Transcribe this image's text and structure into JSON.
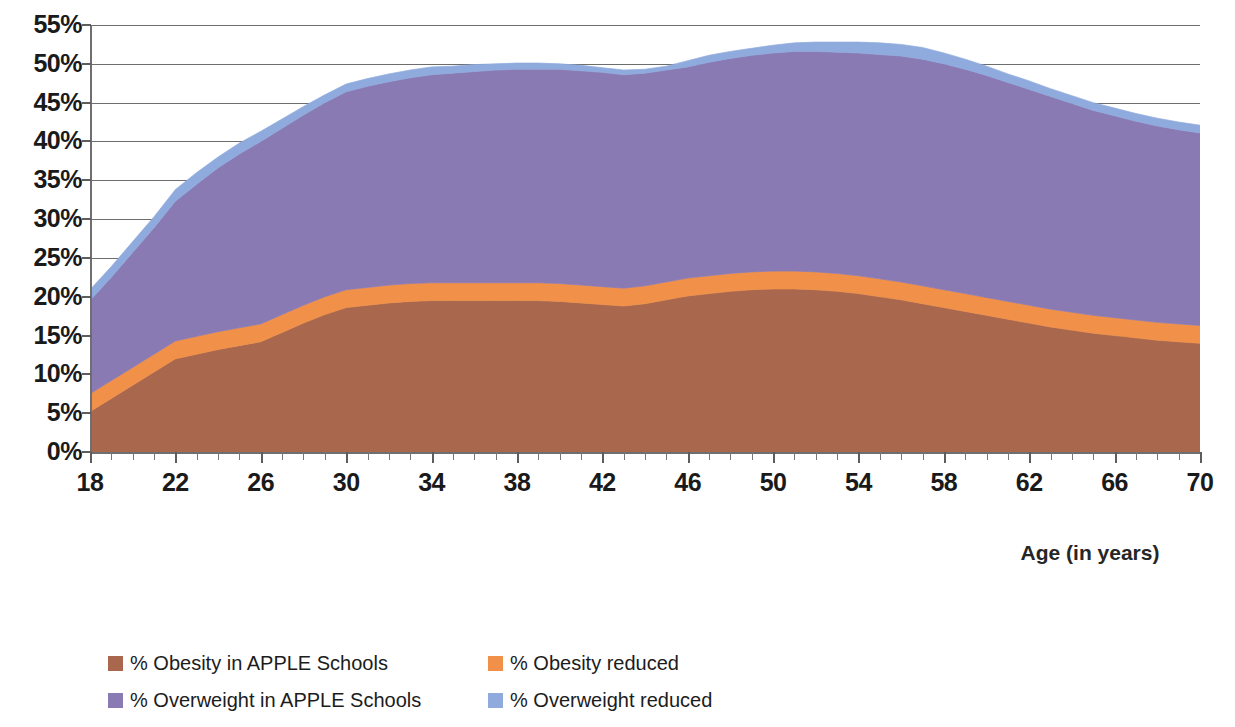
{
  "chart_data": {
    "type": "area",
    "stacked": true,
    "title": "",
    "xlabel": "Age (in years)",
    "ylabel": "",
    "xlim": [
      18,
      70
    ],
    "ylim": [
      0,
      55
    ],
    "y_tick_step": 5,
    "x_major_tick_step": 4,
    "x_minor_tick_step": 1,
    "grid": true,
    "legend_position": "bottom",
    "y_ticks": [
      "0%",
      "5%",
      "10%",
      "15%",
      "20%",
      "25%",
      "30%",
      "35%",
      "40%",
      "45%",
      "50%",
      "55%"
    ],
    "x_ticks": [
      "18",
      "22",
      "26",
      "30",
      "34",
      "38",
      "42",
      "46",
      "50",
      "54",
      "58",
      "62",
      "66",
      "70"
    ],
    "x": [
      18,
      19,
      20,
      21,
      22,
      23,
      24,
      25,
      26,
      27,
      28,
      29,
      30,
      31,
      32,
      33,
      34,
      35,
      36,
      37,
      38,
      39,
      40,
      41,
      42,
      43,
      44,
      45,
      46,
      47,
      48,
      49,
      50,
      51,
      52,
      53,
      54,
      55,
      56,
      57,
      58,
      59,
      60,
      61,
      62,
      63,
      64,
      65,
      66,
      67,
      68,
      69,
      70
    ],
    "series": [
      {
        "name": "% Obesity in APPLE Schools",
        "color": "#a9674e",
        "values": [
          5.2,
          6.9,
          8.6,
          10.3,
          12.0,
          12.6,
          13.2,
          13.7,
          14.2,
          15.4,
          16.6,
          17.7,
          18.6,
          18.9,
          19.2,
          19.4,
          19.5,
          19.5,
          19.5,
          19.5,
          19.5,
          19.5,
          19.4,
          19.2,
          19.0,
          18.8,
          19.1,
          19.6,
          20.1,
          20.4,
          20.7,
          20.9,
          21.0,
          21.0,
          20.9,
          20.7,
          20.4,
          20.0,
          19.6,
          19.1,
          18.6,
          18.1,
          17.6,
          17.1,
          16.6,
          16.1,
          15.7,
          15.3,
          15.0,
          14.7,
          14.4,
          14.2,
          14.0
        ]
      },
      {
        "name": "% Obesity reduced",
        "color": "#f19149",
        "values": [
          2.3,
          2.3,
          2.3,
          2.3,
          2.3,
          2.3,
          2.3,
          2.3,
          2.3,
          2.3,
          2.3,
          2.3,
          2.3,
          2.3,
          2.3,
          2.3,
          2.3,
          2.3,
          2.3,
          2.3,
          2.3,
          2.3,
          2.3,
          2.3,
          2.3,
          2.3,
          2.3,
          2.3,
          2.3,
          2.3,
          2.3,
          2.3,
          2.3,
          2.3,
          2.3,
          2.3,
          2.3,
          2.3,
          2.3,
          2.3,
          2.3,
          2.3,
          2.3,
          2.3,
          2.3,
          2.3,
          2.3,
          2.3,
          2.3,
          2.3,
          2.3,
          2.3,
          2.3
        ]
      },
      {
        "name": "% Overweight in APPLE Schools",
        "color": "#8a7ab4",
        "values": [
          12.0,
          13.3,
          14.8,
          16.3,
          18.0,
          19.6,
          21.1,
          22.4,
          23.5,
          24.0,
          24.5,
          25.0,
          25.5,
          25.9,
          26.2,
          26.5,
          26.8,
          27.0,
          27.2,
          27.4,
          27.5,
          27.5,
          27.6,
          27.6,
          27.6,
          27.5,
          27.4,
          27.3,
          27.2,
          27.5,
          27.7,
          27.9,
          28.1,
          28.3,
          28.4,
          28.5,
          28.7,
          28.9,
          29.1,
          29.2,
          29.1,
          28.9,
          28.6,
          28.2,
          27.8,
          27.4,
          26.9,
          26.4,
          26.0,
          25.6,
          25.3,
          25.0,
          24.8
        ]
      },
      {
        "name": "% Overweight reduced",
        "color": "#8faadc",
        "values": [
          1.4,
          1.4,
          1.4,
          1.4,
          1.5,
          1.5,
          1.4,
          1.4,
          1.3,
          1.2,
          1.1,
          1.0,
          1.0,
          1.0,
          1.0,
          1.0,
          1.0,
          0.9,
          0.9,
          0.8,
          0.8,
          0.8,
          0.7,
          0.7,
          0.6,
          0.6,
          0.5,
          0.5,
          0.8,
          0.9,
          0.9,
          0.9,
          1.0,
          1.1,
          1.2,
          1.3,
          1.4,
          1.5,
          1.5,
          1.5,
          1.4,
          1.3,
          1.2,
          1.1,
          1.1,
          1.0,
          1.0,
          1.0,
          1.0,
          1.0,
          1.0,
          1.0,
          1.0
        ]
      }
    ],
    "legend": [
      {
        "label": "% Obesity in APPLE Schools",
        "color": "#a9674e"
      },
      {
        "label": "% Obesity reduced",
        "color": "#f19149"
      },
      {
        "label": "% Overweight in APPLE Schools",
        "color": "#8a7ab4"
      },
      {
        "label": "% Overweight reduced",
        "color": "#8faadc"
      }
    ]
  },
  "axis": {
    "x_title": "Age (in years)"
  }
}
